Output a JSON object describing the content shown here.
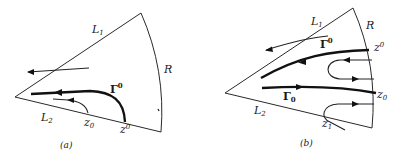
{
  "figure": {
    "panels": [
      {
        "id": "a",
        "caption": "(a)",
        "labels": {
          "L1": "L",
          "L1_sub": "1",
          "L2": "L",
          "L2_sub": "2",
          "R": "R",
          "Gamma_upper": "Γ",
          "Gamma_upper_sup": "0",
          "z_lower_sub": "z",
          "z_lower_sub_idx": "0",
          "z_upper": "z",
          "z_upper_sup": "0"
        }
      },
      {
        "id": "b",
        "caption": "(b)",
        "labels": {
          "L1": "L",
          "L1_sub": "1",
          "L2": "L",
          "L2_sub": "2",
          "R": "R",
          "Gamma_upper": "Γ",
          "Gamma_upper_sup": "0",
          "Gamma_lower": "Γ",
          "Gamma_lower_sub": "0",
          "z_upper": "z",
          "z_upper_sup": "0",
          "z_lower": "z",
          "z_lower_sub": "0",
          "z1": "z",
          "z1_sub": "1"
        }
      }
    ],
    "colors": {
      "ink": "#111111",
      "background": "#ffffff"
    }
  }
}
